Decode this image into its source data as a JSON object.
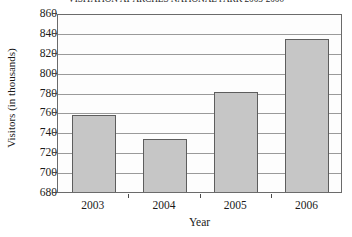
{
  "chart_data": {
    "type": "bar",
    "title": "VISITATION AT ARCHES NATIONAL PARK 2003-2006",
    "xlabel": "Year",
    "ylabel": "Visitors (in thousands)",
    "categories": [
      "2003",
      "2004",
      "2005",
      "2006"
    ],
    "values": [
      759,
      735,
      783,
      836
    ],
    "ylim": [
      680,
      860
    ],
    "yticks": [
      680,
      700,
      720,
      740,
      760,
      780,
      800,
      820,
      840,
      860
    ],
    "ytick_labels": [
      "680",
      "700",
      "720",
      "740",
      "760",
      "780",
      "800",
      "820",
      "840",
      "860"
    ],
    "grid": true,
    "legend": null,
    "series": [
      {
        "name": "Visitors",
        "values": [
          759,
          735,
          783,
          836
        ],
        "bar_color": "#c6c6c6",
        "bar_edge_color": "#5d5d5d"
      }
    ]
  },
  "style": {
    "axis_color": "#6b6b6b",
    "gridline_color": "#9a9a9a",
    "background": "#ffffff",
    "text_color": "#1a1a1a"
  }
}
